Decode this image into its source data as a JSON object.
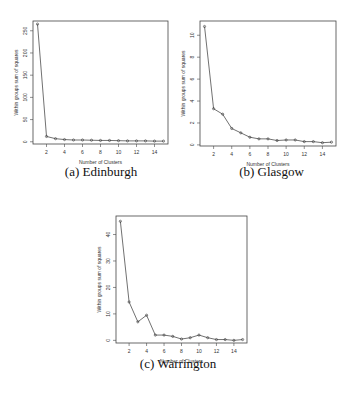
{
  "figure": {
    "panels": [
      {
        "id": "a",
        "caption": "(a) Edinburgh"
      },
      {
        "id": "b",
        "caption": "(b) Glasgow"
      },
      {
        "id": "c",
        "caption": "(c) Warrington"
      }
    ]
  },
  "chart_data": [
    {
      "type": "line",
      "title": "(a) Edinburgh",
      "xlabel": "Number of Clusters",
      "ylabel": "Within groups sum of squares",
      "x": [
        1,
        2,
        3,
        4,
        5,
        6,
        7,
        8,
        9,
        10,
        11,
        12,
        13,
        14,
        15
      ],
      "values": [
        265,
        12,
        7,
        5,
        4,
        4,
        3.5,
        3,
        3,
        2.5,
        2,
        2,
        2,
        1.5,
        1.5
      ],
      "xticks": [
        2,
        4,
        6,
        8,
        10,
        12,
        14
      ],
      "yticks": [
        0,
        50,
        100,
        150,
        200,
        250
      ],
      "xlim": [
        0.5,
        15.5
      ],
      "ylim": [
        -5,
        272
      ],
      "grid": false,
      "marker": "circle"
    },
    {
      "type": "line",
      "title": "(b) Glasgow",
      "xlabel": "Number of Clusters",
      "ylabel": "Within groups sum of squares",
      "x": [
        1,
        2,
        3,
        4,
        5,
        6,
        7,
        8,
        9,
        10,
        11,
        12,
        13,
        14,
        15
      ],
      "values": [
        10.8,
        3.3,
        2.8,
        1.5,
        1.1,
        0.7,
        0.55,
        0.55,
        0.4,
        0.45,
        0.45,
        0.3,
        0.3,
        0.2,
        0.25
      ],
      "xticks": [
        2,
        4,
        6,
        8,
        10,
        12,
        14
      ],
      "yticks": [
        0,
        2,
        4,
        6,
        8,
        10
      ],
      "xlim": [
        0.5,
        15.5
      ],
      "ylim": [
        -0.1,
        11.3
      ],
      "grid": false,
      "marker": "circle"
    },
    {
      "type": "line",
      "title": "(c) Warrington",
      "xlabel": "Number of Clusters",
      "ylabel": "Within groups sum of squares",
      "x": [
        1,
        2,
        3,
        4,
        5,
        6,
        7,
        8,
        9,
        10,
        11,
        12,
        13,
        14,
        15
      ],
      "values": [
        45,
        14.5,
        7,
        9.5,
        2,
        2,
        1.5,
        0.5,
        1,
        2,
        1,
        0.3,
        0.3,
        0,
        0.3
      ],
      "xticks": [
        2,
        4,
        6,
        8,
        10,
        12,
        14
      ],
      "yticks": [
        0,
        10,
        20,
        30,
        40
      ],
      "xlim": [
        0.5,
        15.5
      ],
      "ylim": [
        -1,
        47
      ],
      "grid": false,
      "marker": "circle"
    }
  ]
}
